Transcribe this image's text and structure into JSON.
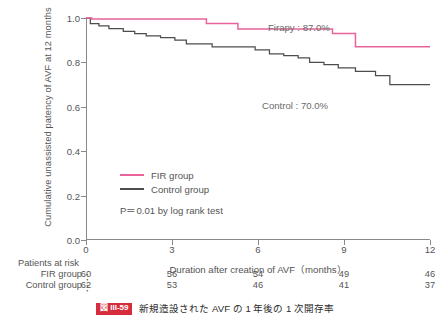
{
  "figure": {
    "caption_badge": "図 III-59",
    "caption_text": "新規造設された AVF の 1 年後の 1 次開存率"
  },
  "legend": {
    "fir_label": "FIR group",
    "control_label": "Control group",
    "pvalue_text": "P＝0.01 by log rank test"
  },
  "annotations": {
    "fir": "Firapy : 87.0%",
    "control": "Control : 70.0%"
  },
  "risk_table": {
    "title": "Patients at risk",
    "fir_label": "FIR group",
    "control_label": "Control group",
    "colon": "：",
    "fir_values": [
      "60",
      "56",
      "54",
      "49",
      "46"
    ],
    "control_values": [
      "62",
      "53",
      "46",
      "41",
      "37"
    ]
  },
  "chart_data": {
    "type": "line",
    "subtype": "kaplan-meier-step",
    "title": "",
    "xlabel": "Duration after creation of AVF（months）",
    "ylabel": "Cumulative unassisted patency of AVF at 12 months",
    "xlim": [
      0,
      12
    ],
    "ylim": [
      0.0,
      1.0
    ],
    "xticks": [
      0,
      3,
      6,
      9,
      12
    ],
    "xticklabels": [
      "0",
      "3",
      "6",
      "9",
      "12"
    ],
    "yticks": [
      0.0,
      0.2,
      0.4,
      0.6,
      0.8,
      1.0
    ],
    "yticklabels": [
      "0.0",
      "0.2",
      "0.4",
      "0.6",
      "0.8",
      "1.0"
    ],
    "grid": false,
    "legend_position": "center-left-inside",
    "colors": {
      "fir": "#e8649b",
      "control": "#4d4d4d",
      "axis": "#8a8a8a",
      "text": "#555555",
      "caption_badge": "#d42e3c"
    },
    "statistics": {
      "p_value": 0.01,
      "test": "log rank test",
      "fir_patency_12mo_pct": 87.0,
      "control_patency_12mo_pct": 70.0
    },
    "series": [
      {
        "name": "FIR group",
        "color": "#e8649b",
        "x": [
          0.0,
          0.2,
          3.3,
          4.2,
          4.6,
          5.3,
          7.6,
          8.6,
          9.4,
          12.0
        ],
        "y": [
          1.0,
          0.995,
          0.995,
          0.975,
          0.975,
          0.95,
          0.95,
          0.93,
          0.87,
          0.87
        ]
      },
      {
        "name": "Control group",
        "color": "#4d4d4d",
        "x": [
          0.0,
          0.15,
          0.45,
          0.8,
          1.3,
          1.7,
          2.1,
          2.6,
          3.1,
          3.5,
          4.4,
          5.3,
          5.9,
          6.4,
          6.9,
          7.4,
          7.8,
          8.3,
          8.8,
          9.4,
          10.1,
          10.6,
          12.0
        ],
        "y": [
          1.0,
          0.975,
          0.965,
          0.952,
          0.94,
          0.93,
          0.92,
          0.912,
          0.9,
          0.884,
          0.87,
          0.87,
          0.856,
          0.838,
          0.83,
          0.82,
          0.8,
          0.79,
          0.775,
          0.76,
          0.74,
          0.7,
          0.7
        ]
      }
    ],
    "risk_table": {
      "times": [
        0,
        3,
        6,
        9,
        12
      ],
      "rows": [
        {
          "name": "FIR group",
          "counts": [
            60,
            56,
            54,
            49,
            46
          ]
        },
        {
          "name": "Control group",
          "counts": [
            62,
            53,
            46,
            41,
            37
          ]
        }
      ]
    }
  }
}
